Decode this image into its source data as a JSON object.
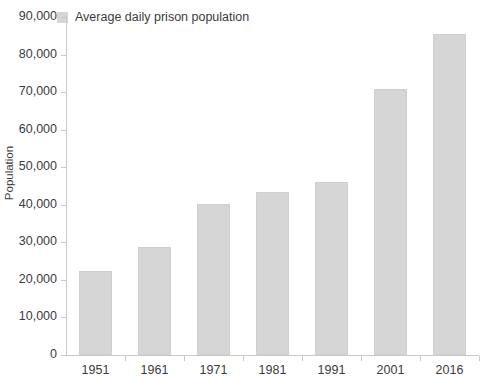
{
  "chart_data": {
    "type": "bar",
    "title": "",
    "subtitle": "",
    "xlabel": "",
    "ylabel": "Population",
    "categories": [
      "1951",
      "1961",
      "1971",
      "1981",
      "1991",
      "2001",
      "2016"
    ],
    "series": [
      {
        "name": "Average daily prison population",
        "values": [
          22300,
          28700,
          40200,
          43300,
          46000,
          70800,
          85600
        ]
      }
    ],
    "ylim": [
      0,
      90000
    ],
    "ytick_values": [
      0,
      10000,
      20000,
      30000,
      40000,
      50000,
      60000,
      70000,
      80000,
      90000
    ],
    "ytick_labels": [
      "0",
      "10,000",
      "20,000",
      "30,000",
      "40,000",
      "50,000",
      "60,000",
      "70,000",
      "80,000",
      "90,000"
    ],
    "grid": false,
    "legend": {
      "position": "top-left",
      "entries": [
        {
          "label": "Average daily prison population",
          "color": "#d6d6d6",
          "swatch_icon": "square-swatch-icon"
        }
      ]
    },
    "colors": {
      "bar_fill": "#d6d6d6",
      "bar_border": "#cfcfcf",
      "axis_line": "#c9c9c9",
      "text": "#3b3b3b",
      "background": "#ffffff"
    }
  }
}
